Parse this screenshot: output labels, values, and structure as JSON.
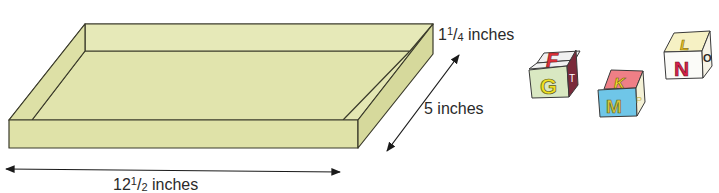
{
  "figure": {
    "tray": {
      "fill_color": "#e3e6b0",
      "side_color": "#dcdfa4",
      "edge_color": "#3a3a2a"
    },
    "labels": {
      "height": {
        "whole": "1",
        "num": "1",
        "den": "4",
        "unit": "inches"
      },
      "depth": {
        "text": "5 inches"
      },
      "length": {
        "whole": "12",
        "num": "1",
        "den": "2",
        "unit": "inches"
      }
    },
    "blocks": [
      {
        "top": "F",
        "front": "G",
        "side": "T",
        "top_color": "#f1f1f1",
        "front_color": "#d9e8c2",
        "side_color": "#7a2a3a",
        "top_letter_color": "#e0303a",
        "front_letter_color": "#f0e020",
        "side_letter_color": "#ffffff"
      },
      {
        "top": "K",
        "front": "M",
        "side": "P",
        "top_color": "#ef7f86",
        "front_color": "#6fc6e8",
        "side_color": "#f4f1d6",
        "top_letter_color": "#f3df2a",
        "front_letter_color": "#d8c83a",
        "side_letter_color": "#c8b850"
      },
      {
        "top": "L",
        "front": "N",
        "side": "O",
        "top_color": "#f6f1c4",
        "front_color": "#fbfbf8",
        "side_color": "#f6f3e6",
        "top_letter_color": "#e8c020",
        "front_letter_color": "#d8204a",
        "side_letter_color": "#2a2a2a"
      }
    ]
  }
}
